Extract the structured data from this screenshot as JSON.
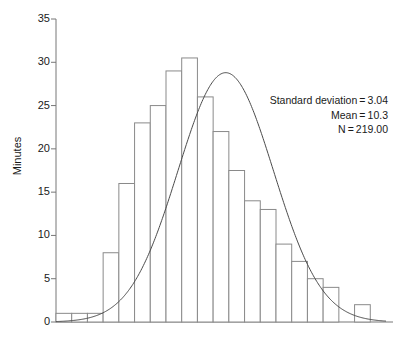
{
  "chart_data": {
    "type": "bar",
    "title": "",
    "subtitle": "",
    "xlabel": "",
    "ylabel": "Minutes",
    "ylim": [
      0,
      35
    ],
    "yticks": [
      0,
      5,
      10,
      15,
      20,
      25,
      30,
      35
    ],
    "ytick_labels": [
      "0",
      "5",
      "10",
      "15",
      "20",
      "25",
      "30",
      "35"
    ],
    "grid": false,
    "legend": "none",
    "xtick_labels": [],
    "bar_style": "histogram-outline",
    "bar_fill": "#ffffff",
    "bar_stroke": "#8a8a8a",
    "overlay_curve": {
      "name": "normal-distribution-curve",
      "stroke": "#4a4a4a",
      "mean": 10.3,
      "std_dev": 3.04,
      "n": 219,
      "peak_value": 28.8
    },
    "categories": [
      "1",
      "2",
      "3",
      "4",
      "5",
      "6",
      "7",
      "8",
      "9",
      "10",
      "11",
      "12",
      "13",
      "14",
      "15",
      "16",
      "17",
      "18",
      "19",
      "20",
      "21"
    ],
    "values": [
      1,
      1,
      1,
      8,
      16,
      23,
      25,
      29,
      30.5,
      26,
      22,
      17.5,
      14,
      13,
      9,
      7,
      5,
      4,
      0,
      2,
      0
    ],
    "annotations": [
      "Standard deviation = 3.04",
      "Mean = 10.3",
      "N = 219.00"
    ]
  },
  "annotation": {
    "std_dev_line": "Standard deviation = 3.04",
    "mean_line": "Mean = 10.3",
    "n_line": "N = 219.00"
  },
  "axes": {
    "y_title": "Minutes"
  },
  "icons": {
    "y_axis": "vertical-axis-line",
    "x_axis": "horizontal-axis-line"
  }
}
